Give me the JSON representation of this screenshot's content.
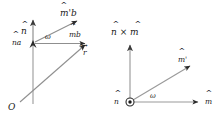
{
  "figure": {
    "colors": {
      "ink": "#1a1a1a",
      "axis_gray": "#8a8a8a",
      "arrow_dark": "#2b2b2b",
      "background": "#ffffff"
    }
  },
  "left_panel": {
    "name": "world-frame-panel",
    "labels": {
      "origin": "O",
      "axis_vector": "n",
      "axis_point": "na",
      "tip_start": "mb",
      "tip_rotated": "m'b",
      "angle": "ω",
      "position_vector": "r"
    },
    "hats": {
      "axis_vector": "^",
      "axis_point": "^",
      "tip_start": "^",
      "tip_rotated": "^",
      "position_vector": "→"
    },
    "geometry": {
      "origin_px": [
        18,
        104
      ],
      "pivot_px": [
        33,
        43
      ],
      "axis_top_px": [
        33,
        17
      ],
      "tip_start_px": [
        88,
        43
      ],
      "tip_rotated_px": [
        80,
        19
      ],
      "r_tip_px": [
        88,
        46
      ]
    }
  },
  "right_panel": {
    "name": "rotation-plane-panel",
    "labels": {
      "axis_out_of_page": "n",
      "cross_product": "n × m",
      "base_vector": "m",
      "rotated_vector": "m'",
      "angle": "ω"
    },
    "hats": {
      "axis_out_of_page": "^",
      "base_vector": "^",
      "rotated_vector": "^"
    },
    "symbols": {
      "out_of_page": "⊙"
    },
    "geometry": {
      "origin_px": [
        20,
        102
      ],
      "x_tip_px": [
        96,
        102
      ],
      "y_tip_px": [
        20,
        43
      ],
      "diag_tip_px": [
        85,
        63
      ]
    }
  }
}
